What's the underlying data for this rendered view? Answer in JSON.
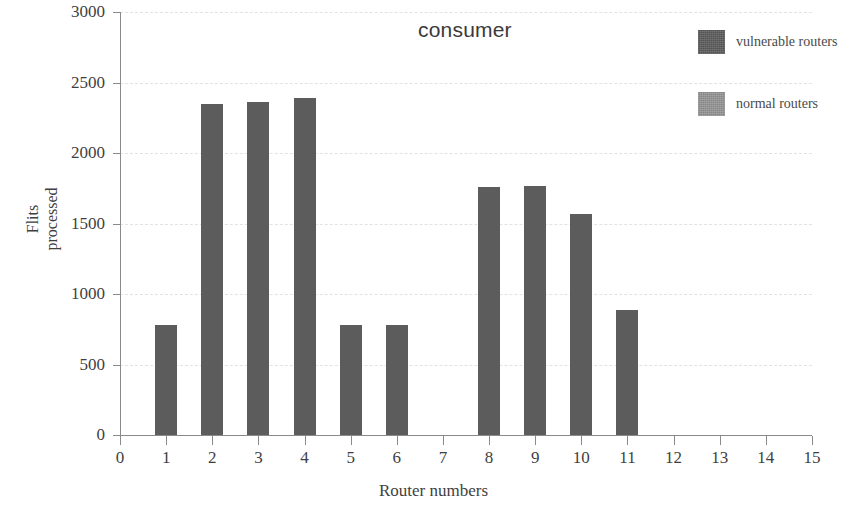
{
  "chart_data": {
    "type": "bar",
    "title": "consumer",
    "xlabel": "Router numbers",
    "ylabel": "Flits\nprocessed",
    "ylabel_lines": [
      "Flits",
      "processed"
    ],
    "categories": [
      "0",
      "1",
      "2",
      "3",
      "4",
      "5",
      "6",
      "7",
      "8",
      "9",
      "10",
      "11",
      "12",
      "13",
      "14",
      "15"
    ],
    "values": [
      0,
      780,
      2345,
      2360,
      2390,
      780,
      780,
      0,
      1760,
      1765,
      1565,
      890,
      0,
      0,
      0,
      0
    ],
    "series": [
      {
        "name": "vulnerable routers",
        "color": "#5c5c5c",
        "values": [
          0,
          780,
          2345,
          2360,
          2390,
          780,
          780,
          0,
          1760,
          1765,
          1565,
          890,
          0,
          0,
          0,
          0
        ]
      }
    ],
    "xlim": [
      0,
      15
    ],
    "ylim": [
      0,
      3000
    ],
    "ytick_labels": [
      "3000",
      "2500",
      "2000",
      "1500",
      "1000",
      "500",
      "0"
    ],
    "ytick_values": [
      3000,
      2500,
      2000,
      1500,
      1000,
      500,
      0
    ],
    "xtick_labels": [
      "0",
      "1",
      "2",
      "3",
      "4",
      "5",
      "6",
      "7",
      "8",
      "9",
      "10",
      "11",
      "12",
      "13",
      "14",
      "15"
    ],
    "grid": true,
    "grid_axis": "y",
    "grid_color": "#e2e2e2",
    "legend_position": "top-right",
    "legend": [
      {
        "label": "vulnerable routers",
        "color": "#5c5c5c"
      },
      {
        "label": "normal routers",
        "color": "#949494"
      }
    ]
  },
  "colors": {
    "bar_vulnerable": "#5c5c5c",
    "bar_normal": "#949494",
    "axis": "#8a8a8a",
    "grid": "#e2e2e2",
    "text": "#3f3f3f",
    "background": "#ffffff"
  }
}
